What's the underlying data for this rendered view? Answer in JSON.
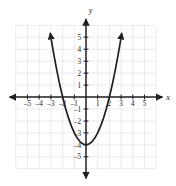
{
  "figure": {
    "name": "coordinate-plane-parabola"
  },
  "chart_data": {
    "type": "line",
    "title": "",
    "subtitle": "",
    "xlabel": "x",
    "ylabel": "y",
    "xlim": [
      -6,
      6
    ],
    "ylim": [
      -6,
      6
    ],
    "grid": true,
    "legend": null,
    "equation": "y = x^2 - 4",
    "vertex": [
      0,
      -4
    ],
    "x_intercepts": [
      -2,
      2
    ],
    "y_intercept": -4,
    "x_ticks": [
      -5,
      -4,
      -3,
      -2,
      -1,
      1,
      2,
      3,
      4,
      5
    ],
    "x_tick_labels": [
      "–5",
      "–4",
      "–3",
      "–2",
      "–1",
      "1",
      "2",
      "3",
      "4",
      "5"
    ],
    "y_ticks": [
      5,
      4,
      3,
      2,
      1,
      -1,
      -2,
      -3,
      -4,
      -5
    ],
    "y_tick_labels": [
      "5",
      "4",
      "3",
      "2",
      "1",
      "–1",
      "–2",
      "–3",
      "–4",
      "–5"
    ],
    "series": [
      {
        "name": "parabola",
        "color": "#231f20",
        "points": [
          [
            -3.05,
            5.3
          ],
          [
            -2.9,
            4.41
          ],
          [
            -2.7,
            3.29
          ],
          [
            -2.5,
            2.25
          ],
          [
            -2.25,
            1.0625
          ],
          [
            -2.0,
            0
          ],
          [
            -1.75,
            -0.9375
          ],
          [
            -1.5,
            -1.75
          ],
          [
            -1.25,
            -2.4375
          ],
          [
            -1.0,
            -3.0
          ],
          [
            -0.75,
            -3.4375
          ],
          [
            -0.5,
            -3.75
          ],
          [
            -0.25,
            -3.9375
          ],
          [
            0,
            -4
          ],
          [
            0.25,
            -3.9375
          ],
          [
            0.5,
            -3.75
          ],
          [
            0.75,
            -3.4375
          ],
          [
            1.0,
            -3.0
          ],
          [
            1.25,
            -2.4375
          ],
          [
            1.5,
            -1.75
          ],
          [
            1.75,
            -0.9375
          ],
          [
            2.0,
            0
          ],
          [
            2.25,
            1.0625
          ],
          [
            2.5,
            2.25
          ],
          [
            2.7,
            3.29
          ],
          [
            2.9,
            4.41
          ],
          [
            3.05,
            5.3
          ]
        ]
      }
    ]
  },
  "axes": {
    "x_axis_label": "x",
    "y_axis_label": "y",
    "arrow_directions": [
      "left",
      "right",
      "up",
      "down"
    ]
  },
  "colors": {
    "curve": "#231f20",
    "axis": "#231f20",
    "grid": "#e9e9ec",
    "background": "#ffffff",
    "tick_text": "#231f20"
  }
}
